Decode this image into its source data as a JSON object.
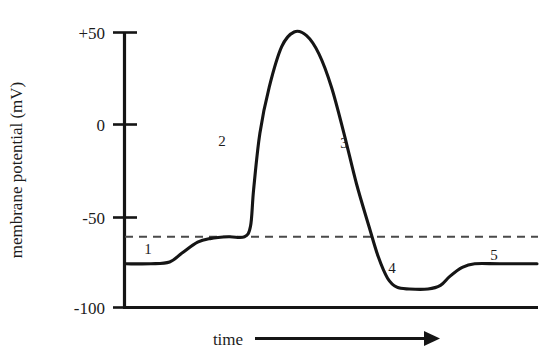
{
  "chart_data": {
    "type": "line",
    "title": "",
    "xlabel": "time",
    "ylabel": "membrane potential (mV)",
    "ylim": [
      -100,
      60
    ],
    "yticks": [
      50,
      0,
      -50,
      -100
    ],
    "ytick_labels": [
      "+50",
      "0",
      "-50",
      "-100"
    ],
    "xticks": [],
    "xtick_labels": [],
    "grid": false,
    "legend": "none",
    "x_axis_style": "arrow",
    "series": [
      {
        "name": "action potential",
        "points": [
          {
            "x": 0,
            "y": -76
          },
          {
            "x": 8,
            "y": -76
          },
          {
            "x": 14,
            "y": -75
          },
          {
            "x": 18,
            "y": -70
          },
          {
            "x": 23,
            "y": -64
          },
          {
            "x": 27,
            "y": -62
          },
          {
            "x": 33,
            "y": -61
          },
          {
            "x": 38,
            "y": -61
          },
          {
            "x": 40,
            "y": -55
          },
          {
            "x": 41,
            "y": -35
          },
          {
            "x": 43,
            "y": -5
          },
          {
            "x": 46,
            "y": 20
          },
          {
            "x": 50,
            "y": 42
          },
          {
            "x": 54,
            "y": 50
          },
          {
            "x": 58,
            "y": 48
          },
          {
            "x": 62,
            "y": 38
          },
          {
            "x": 66,
            "y": 20
          },
          {
            "x": 70,
            "y": -5
          },
          {
            "x": 74,
            "y": -32
          },
          {
            "x": 78,
            "y": -55
          },
          {
            "x": 81,
            "y": -72
          },
          {
            "x": 84,
            "y": -84
          },
          {
            "x": 87,
            "y": -89
          },
          {
            "x": 91,
            "y": -90
          },
          {
            "x": 97,
            "y": -90
          },
          {
            "x": 101,
            "y": -88
          },
          {
            "x": 104,
            "y": -83
          },
          {
            "x": 108,
            "y": -78
          },
          {
            "x": 112,
            "y": -76
          },
          {
            "x": 120,
            "y": -76
          },
          {
            "x": 132,
            "y": -76
          }
        ]
      }
    ],
    "annotations": {
      "threshold": {
        "label": "",
        "value": -61,
        "style": "dashed"
      },
      "phase_labels": [
        {
          "id": "1",
          "text": "1",
          "x": 148,
          "y": 254
        },
        {
          "id": "2",
          "text": "2",
          "x": 222,
          "y": 146
        },
        {
          "id": "3",
          "text": "3",
          "x": 344,
          "y": 148
        },
        {
          "id": "4",
          "text": "4",
          "x": 392,
          "y": 273
        },
        {
          "id": "5",
          "text": "5",
          "x": 494,
          "y": 260
        }
      ]
    }
  },
  "axes": {
    "y_title": "membrane potential (mV)",
    "x_title": "time",
    "tick_labels": {
      "t_plus50": "+50",
      "t_zero": "0",
      "t_minus50": "-50",
      "t_minus100": "-100"
    }
  },
  "colors": {
    "ink": "#151515",
    "dash": "#4a4a4a",
    "background": "#ffffff"
  }
}
